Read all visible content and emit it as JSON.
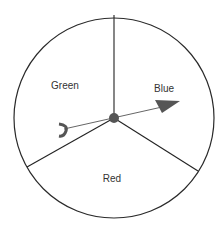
{
  "spinner": {
    "sections": [
      {
        "label": "Green",
        "position": "upper-left"
      },
      {
        "label": "Blue",
        "position": "upper-right"
      },
      {
        "label": "Red",
        "position": "bottom"
      }
    ],
    "colors": {
      "outline": "#2a2a2a",
      "pointer": "#555555",
      "pivot": "#555555",
      "text": "#333333"
    }
  }
}
